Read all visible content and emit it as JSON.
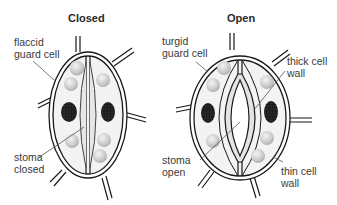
{
  "diagram": {
    "panels": [
      {
        "title": "Closed",
        "labels": {
          "guard_cell": "flaccid\nguard cell",
          "stoma": "stoma\nclosed"
        }
      },
      {
        "title": "Open",
        "labels": {
          "guard_cell": "turgid\nguard cell",
          "stoma": "stoma\nopen",
          "thick_wall": "thick cell\nwall",
          "thin_wall": "thin cell\nwall"
        }
      }
    ],
    "colors": {
      "outline": "#1a1a1a",
      "cytoplasm": "#f1f1f1",
      "chloroplast": "#c8c8c8",
      "nucleus": "#202020",
      "label_line": "#555555"
    }
  }
}
